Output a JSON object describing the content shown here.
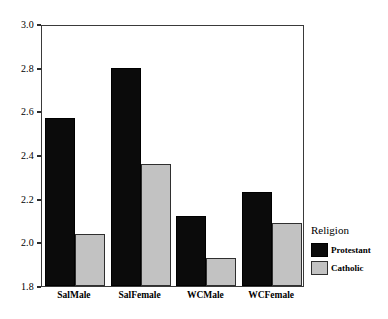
{
  "chart_data": {
    "type": "bar",
    "title": "",
    "xlabel": "",
    "ylabel": "",
    "categories": [
      "SalMale",
      "SalFemale",
      "WCMale",
      "WCFemale"
    ],
    "series": [
      {
        "name": "Protestant",
        "color": "#0b0b0b",
        "values": [
          2.57,
          2.8,
          2.12,
          2.23
        ]
      },
      {
        "name": "Catholic",
        "color": "#c2c2c2",
        "values": [
          2.04,
          2.36,
          1.93,
          2.09
        ]
      }
    ],
    "ylim": [
      1.8,
      3.0
    ],
    "ytick_labels": [
      "1.8",
      "2.0",
      "2.2",
      "2.4",
      "2.6",
      "2.8",
      "3.0"
    ],
    "ytick_values": [
      1.8,
      2.0,
      2.2,
      2.4,
      2.6,
      2.8,
      3.0
    ],
    "grid": false,
    "legend": {
      "title": "Religion",
      "position": "right",
      "entries": [
        {
          "label": "Protestant",
          "color": "#0b0b0b"
        },
        {
          "label": "Catholic",
          "color": "#c2c2c2"
        }
      ]
    }
  }
}
